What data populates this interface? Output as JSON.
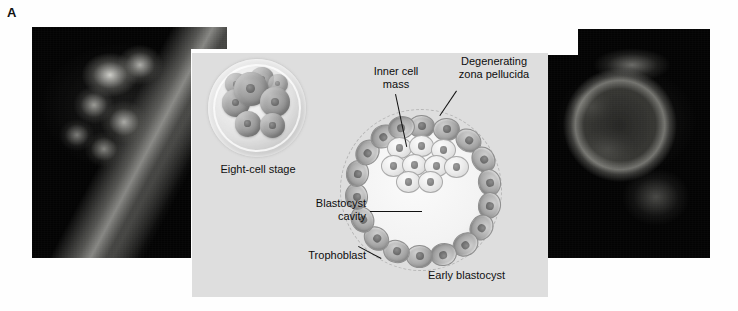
{
  "figure": {
    "panel_letter": "A",
    "panel_background_color": "#dedede",
    "page_background_color": "#ffffff"
  },
  "photos": [
    {
      "name": "morula-micrograph",
      "position": "left",
      "description": "dark-field light micrograph of cleaving embryo / morula"
    },
    {
      "name": "blastocyst-micrograph",
      "position": "right",
      "description": "dark-field light micrograph of early blastocyst"
    }
  ],
  "illustration": {
    "eight_cell": {
      "caption": "Eight-cell stage",
      "cell_count": 8
    },
    "blastocyst": {
      "caption": "Early blastocyst",
      "labels": [
        {
          "id": "inner-cell-mass",
          "line1": "Inner cell",
          "line2": "mass",
          "text": "Inner cell mass"
        },
        {
          "id": "degenerating-zona-pellucida",
          "line1": "Degenerating",
          "line2": "zona pellucida",
          "text": "Degenerating zona pellucida"
        },
        {
          "id": "blastocyst-cavity",
          "line1": "Blastocyst",
          "line2": "cavity",
          "text": "Blastocyst cavity"
        },
        {
          "id": "trophoblast",
          "line1": "Trophoblast",
          "line2": "",
          "text": "Trophoblast"
        }
      ]
    }
  }
}
